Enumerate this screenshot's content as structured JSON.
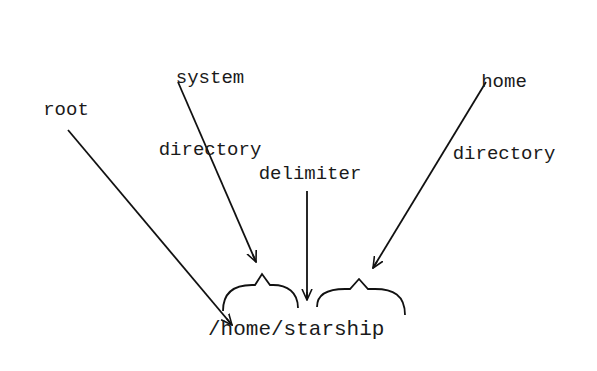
{
  "diagram": {
    "labels": {
      "system_line1": "system",
      "system_line2": "directory",
      "home_line1": "home",
      "home_line2": "directory",
      "root": "root",
      "delimiter": "delimiter",
      "path": "/home/starship"
    },
    "stroke_color": "#111111",
    "text_color": "#1a1a1a",
    "background": "#ffffff"
  }
}
